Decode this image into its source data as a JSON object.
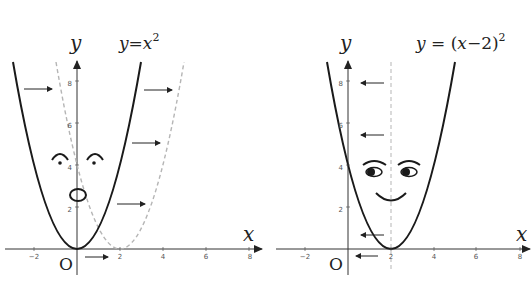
{
  "left_graph": {
    "equation": {
      "y": "y",
      "eq": "=",
      "x": "x",
      "exp": "2"
    },
    "axis": {
      "x_label": "x",
      "y_label": "y",
      "origin_label": "O"
    },
    "x_ticks": [
      "−2",
      "2",
      "4",
      "6",
      "8"
    ],
    "y_ticks": [
      "2",
      "4",
      "6",
      "8"
    ],
    "curve_solid": "y = x^2",
    "curve_dashed": "y = (x-2)^2",
    "arrow_direction": "right",
    "face": {
      "eyes": "arched brows with dot pupils",
      "mouth": "oval (surprised)"
    }
  },
  "right_graph": {
    "equation": {
      "y": "y",
      "eq": " = (",
      "x": "x",
      "rest": "−2)",
      "exp": "2"
    },
    "axis": {
      "x_label": "x",
      "y_label": "y",
      "origin_label": "O"
    },
    "x_ticks": [
      "−2",
      "2",
      "4",
      "6",
      "8"
    ],
    "y_ticks": [
      "2",
      "4",
      "6",
      "8"
    ],
    "curve_solid": "y = (x-2)^2",
    "axis_of_symmetry": "x = 2 (dashed)",
    "arrow_direction": "left",
    "face": {
      "eyes": "side-glancing eyes with brows",
      "mouth": "smile"
    }
  },
  "colors": {
    "curve": "#1a1a1a",
    "dashed": "#b5b5b5",
    "axis": "#333333",
    "arrow": "#222222"
  }
}
